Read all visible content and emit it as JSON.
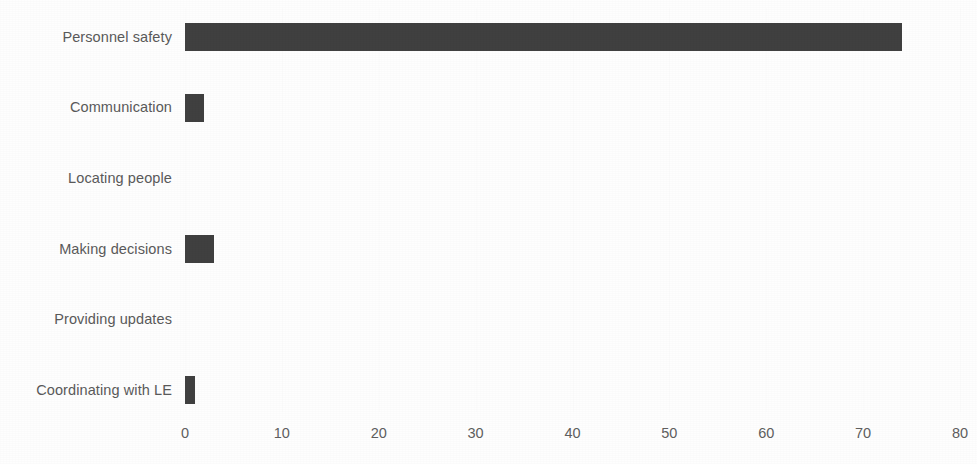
{
  "chart_data": {
    "type": "bar",
    "orientation": "horizontal",
    "title": "",
    "subtitle": "",
    "xlabel": "",
    "ylabel": "",
    "categories": [
      "Personnel safety",
      "Communication",
      "Locating people",
      "Making decisions",
      "Providing updates",
      "Coordinating with LE"
    ],
    "values": [
      74,
      2,
      0,
      3,
      0,
      1
    ],
    "xlim": [
      0,
      80
    ],
    "xticks": [
      0,
      10,
      20,
      30,
      40,
      50,
      60,
      70,
      80
    ],
    "xtick_labels": [
      "0",
      "10",
      "20",
      "30",
      "40",
      "50",
      "60",
      "70",
      "80"
    ],
    "grid": "faint-vertical",
    "legend": null,
    "legend_position": "none",
    "bar_color": "#404040",
    "label_color": "#5a5a5a",
    "tick_color": "#5f5f5f",
    "background_color": "#fefefe"
  },
  "axis": {
    "min": 0,
    "max": 80,
    "step": 10
  }
}
